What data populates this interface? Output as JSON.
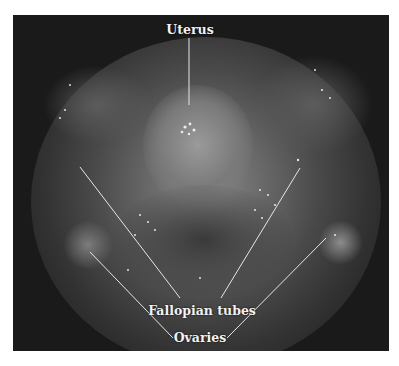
{
  "figure": {
    "type": "annotated laparoscopic photograph",
    "labels": {
      "uterus": "Uterus",
      "fallopian_tubes": "Fallopian tubes",
      "ovaries": "Ovaries"
    },
    "colors": {
      "background": "#ffffff",
      "photo_dark": "#1a1a1a",
      "label_text": "#f2f2f2",
      "leader_lines": "#e6e6e6"
    }
  }
}
